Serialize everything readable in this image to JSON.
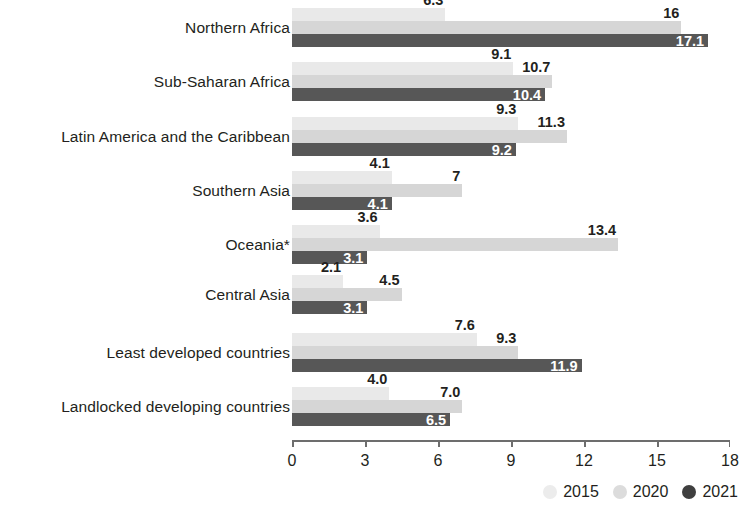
{
  "chart_data": {
    "type": "bar",
    "orientation": "horizontal",
    "title": "",
    "xlabel": "",
    "ylabel": "",
    "xlim": [
      0,
      18
    ],
    "xticks": [
      0,
      3,
      6,
      9,
      12,
      15,
      18
    ],
    "xtick_labels": [
      "0",
      "3",
      "6",
      "9",
      "12",
      "15",
      "18"
    ],
    "grid": false,
    "legend_position": "bottom-right",
    "categories": [
      "Northern Africa",
      "Sub-Saharan Africa",
      "Latin America and the Caribbean",
      "Southern Asia",
      "Oceania*",
      "Central Asia",
      "Least developed countries",
      "Landlocked developing countries"
    ],
    "series": [
      {
        "name": "2015",
        "color": "#e9e9e9",
        "values": [
          6.3,
          9.1,
          9.3,
          4.1,
          3.6,
          2.1,
          7.6,
          4.0
        ],
        "labels": [
          "6.3",
          "9.1",
          "9.3",
          "4.1",
          "3.6",
          "2.1",
          "7.6",
          "4.0"
        ]
      },
      {
        "name": "2020",
        "color": "#d6d6d6",
        "values": [
          16,
          10.7,
          11.3,
          7,
          13.4,
          4.5,
          9.3,
          7.0
        ],
        "labels": [
          "16",
          "10.7",
          "11.3",
          "7",
          "13.4",
          "4.5",
          "9.3",
          "7.0"
        ]
      },
      {
        "name": "2021",
        "color": "#575757",
        "values": [
          17.1,
          10.4,
          9.2,
          4.1,
          3.1,
          3.1,
          11.9,
          6.5
        ],
        "labels": [
          "17.1",
          "10.4",
          "9.2",
          "4.1",
          "3.1",
          "3.1",
          "11.9",
          "6.5"
        ]
      }
    ]
  },
  "legend": {
    "items": [
      {
        "label": "2015",
        "swatch": "circle-swatch-2015"
      },
      {
        "label": "2020",
        "swatch": "circle-swatch-2020"
      },
      {
        "label": "2021",
        "swatch": "circle-swatch-2021"
      }
    ]
  }
}
